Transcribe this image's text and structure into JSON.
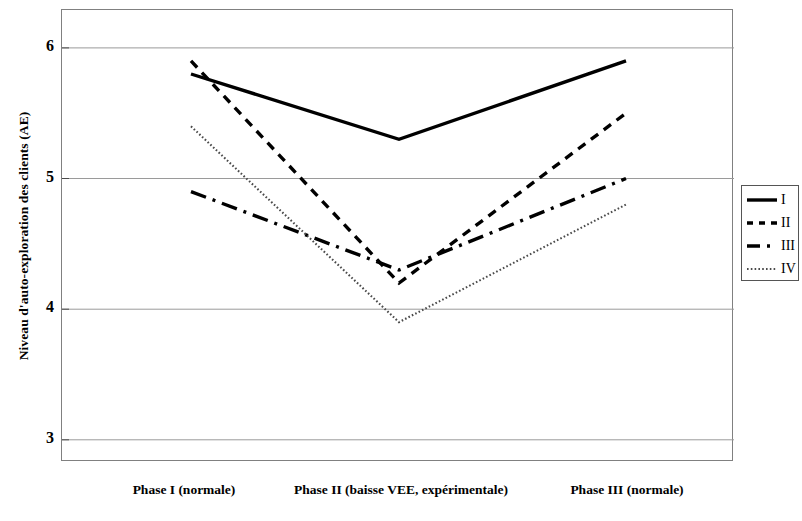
{
  "chart": {
    "ylabel": "Niveau d'auto-exploration des clients (AE)",
    "yticks": [
      "6",
      "5",
      "4",
      "3"
    ],
    "xlabels": [
      "Phase I (normale)",
      "Phase II (baisse VEE, expérimentale)",
      "Phase III (normale)"
    ],
    "legend": [
      {
        "label": "I",
        "style": "solid"
      },
      {
        "label": "II",
        "style": "dashed"
      },
      {
        "label": "III",
        "style": "dash-dot"
      },
      {
        "label": "IV",
        "style": "dotted"
      }
    ]
  },
  "chart_data": {
    "type": "line",
    "title": "",
    "xlabel": "",
    "ylabel": "Niveau d'auto-exploration des clients (AE)",
    "categories": [
      "Phase I (normale)",
      "Phase II (baisse VEE, expérimentale)",
      "Phase III (normale)"
    ],
    "series": [
      {
        "name": "I",
        "values": [
          5.8,
          5.3,
          5.9
        ],
        "style": "solid",
        "color": "#000000"
      },
      {
        "name": "II",
        "values": [
          5.9,
          4.2,
          5.5
        ],
        "style": "dashed",
        "color": "#000000"
      },
      {
        "name": "III",
        "values": [
          4.9,
          4.3,
          5.0
        ],
        "style": "dash-dot",
        "color": "#000000"
      },
      {
        "name": "IV",
        "values": [
          5.4,
          3.9,
          4.8
        ],
        "style": "dotted",
        "color": "#000000"
      }
    ],
    "ylim": [
      2.83,
      6.29
    ],
    "yticks": [
      3,
      4,
      5,
      6
    ],
    "grid": true,
    "grid_color": "#9a9a9a",
    "legend_position": "right",
    "frame_color": "#808080",
    "background": "#ffffff"
  }
}
